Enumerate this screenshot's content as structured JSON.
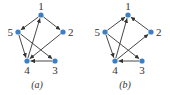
{
  "colors": {
    "node": "#3b7fc4",
    "edge": "#333333",
    "label": "#333333"
  },
  "graphs": [
    {
      "caption": "(a)",
      "nodes": [
        {
          "id": "1",
          "x": 41,
          "y": 15
        },
        {
          "id": "2",
          "x": 63,
          "y": 32
        },
        {
          "id": "3",
          "x": 55,
          "y": 61
        },
        {
          "id": "4",
          "x": 27,
          "y": 61
        },
        {
          "id": "5",
          "x": 18,
          "y": 32
        }
      ],
      "edges": [
        {
          "from": "1",
          "to": "5"
        },
        {
          "from": "1",
          "to": "2"
        },
        {
          "from": "4",
          "to": "1"
        },
        {
          "from": "5",
          "to": "4"
        },
        {
          "from": "5",
          "to": "3"
        },
        {
          "from": "3",
          "to": "4"
        },
        {
          "from": "2",
          "to": "4"
        }
      ]
    },
    {
      "caption": "(b)",
      "nodes": [
        {
          "id": "1",
          "x": 43,
          "y": 15
        },
        {
          "id": "2",
          "x": 66,
          "y": 32
        },
        {
          "id": "3",
          "x": 57,
          "y": 61
        },
        {
          "id": "4",
          "x": 30,
          "y": 61
        },
        {
          "id": "5",
          "x": 20,
          "y": 32
        }
      ],
      "edges": [
        {
          "from": "5",
          "to": "1"
        },
        {
          "from": "2",
          "to": "1"
        },
        {
          "from": "4",
          "to": "1"
        },
        {
          "from": "5",
          "to": "4"
        },
        {
          "from": "5",
          "to": "3"
        },
        {
          "from": "3",
          "to": "4"
        },
        {
          "from": "4",
          "to": "2"
        }
      ]
    }
  ]
}
